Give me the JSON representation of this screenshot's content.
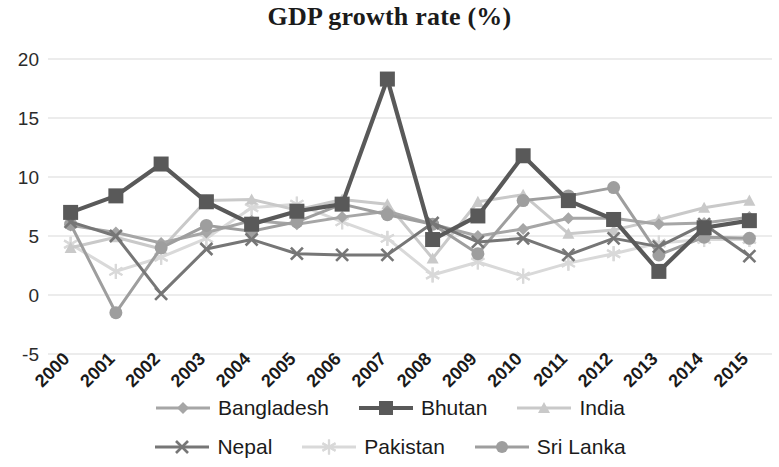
{
  "chart_data": {
    "type": "line",
    "title": "GDP growth rate (%)",
    "xlabel": "",
    "ylabel": "",
    "categories": [
      "2000",
      "2001",
      "2002",
      "2003",
      "2004",
      "2005",
      "2006",
      "2007",
      "2008",
      "2009",
      "2010",
      "2011",
      "2012",
      "2013",
      "2014",
      "2015"
    ],
    "ylim": [
      -5,
      20
    ],
    "yticks": [
      -5,
      0,
      5,
      10,
      15,
      20
    ],
    "ytick_labels": [
      "-5",
      "0",
      "5",
      "10",
      "15",
      "20"
    ],
    "grid": true,
    "legend_position": "bottom",
    "series": [
      {
        "name": "Bangladesh",
        "marker": "diamond",
        "color": "#A6A6A6",
        "values": [
          5.9,
          5.3,
          4.4,
          5.3,
          6.3,
          6.0,
          6.6,
          7.1,
          6.0,
          5.0,
          5.6,
          6.5,
          6.5,
          6.0,
          6.1,
          6.6
        ]
      },
      {
        "name": "Bhutan",
        "marker": "square",
        "color": "#595959",
        "values": [
          7.0,
          8.4,
          11.1,
          7.9,
          6.0,
          7.1,
          7.7,
          18.3,
          4.7,
          6.7,
          11.8,
          8.0,
          6.4,
          2.0,
          5.7,
          6.3
        ]
      },
      {
        "name": "India",
        "marker": "triangle",
        "color": "#C9C9C9",
        "values": [
          4.0,
          4.9,
          3.9,
          8.0,
          8.1,
          7.2,
          8.1,
          7.7,
          3.1,
          7.9,
          8.5,
          5.2,
          5.5,
          6.4,
          7.4,
          8.0
        ]
      },
      {
        "name": "Nepal",
        "marker": "x",
        "color": "#767676",
        "values": [
          6.2,
          5.0,
          0.1,
          3.9,
          4.7,
          3.5,
          3.4,
          3.4,
          6.1,
          4.5,
          4.8,
          3.4,
          4.8,
          4.1,
          6.0,
          3.3
        ]
      },
      {
        "name": "Pakistan",
        "marker": "star",
        "color": "#D9D9D9",
        "values": [
          4.3,
          2.0,
          3.2,
          4.8,
          7.4,
          7.7,
          6.2,
          4.8,
          1.7,
          2.8,
          1.6,
          2.7,
          3.5,
          4.4,
          4.7,
          4.7
        ]
      },
      {
        "name": "Sri Lanka",
        "marker": "circle",
        "color": "#9E9E9E",
        "values": [
          6.0,
          -1.5,
          4.0,
          5.9,
          5.4,
          6.2,
          7.7,
          6.8,
          6.0,
          3.5,
          8.0,
          8.4,
          9.1,
          3.4,
          4.9,
          4.8
        ]
      }
    ]
  },
  "legend": {
    "items": [
      {
        "label": "Bangladesh"
      },
      {
        "label": "Bhutan"
      },
      {
        "label": "India"
      },
      {
        "label": "Nepal"
      },
      {
        "label": "Pakistan"
      },
      {
        "label": "Sri Lanka"
      }
    ]
  }
}
